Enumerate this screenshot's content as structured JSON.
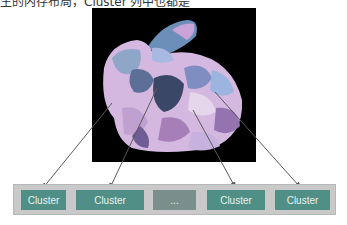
{
  "caption": "生的内存布局，Cluster 列中也都是",
  "figure": {
    "render_label": "stanford-bunny-meshlet-clusters",
    "colors": {
      "background": "#000000",
      "bar_fill": "#c9c9c9",
      "cell_fill": "#4f8f86",
      "ellipsis_fill": "#7a8f8c",
      "arrow": "#5a5a5a"
    }
  },
  "cluster_bar": {
    "cells": [
      {
        "label": "Cluster"
      },
      {
        "label": "Cluster"
      },
      {
        "label": "..."
      },
      {
        "label": "Cluster"
      },
      {
        "label": "Cluster"
      }
    ]
  }
}
